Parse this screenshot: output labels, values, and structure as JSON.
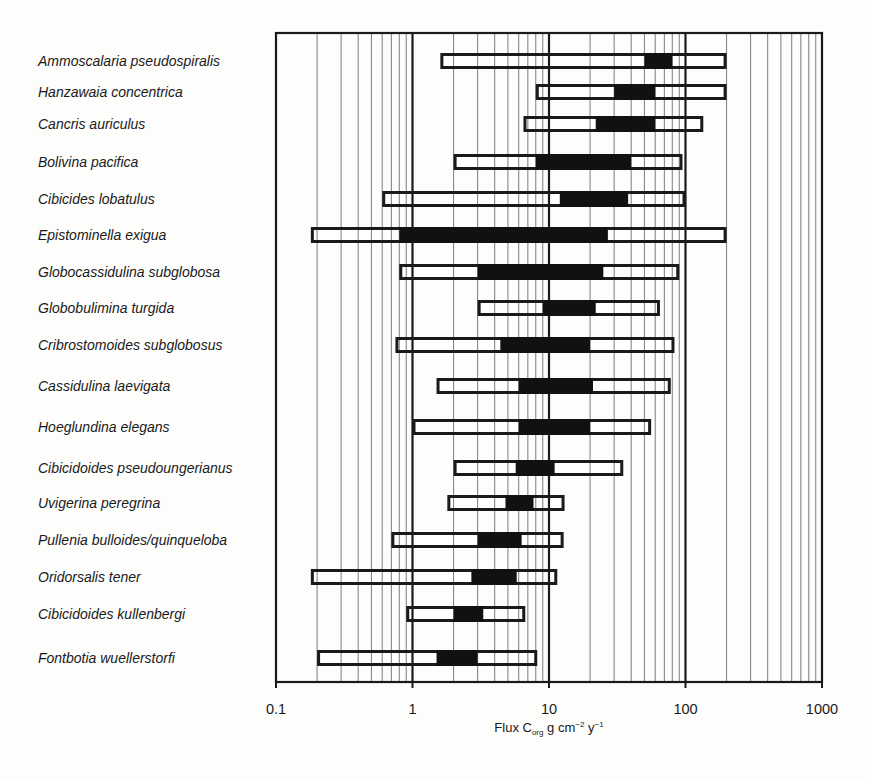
{
  "chart_data": {
    "type": "range-bar",
    "title": "",
    "xlabel": "Flux C_org g cm^-2 y^-1",
    "xlabel_parts": {
      "main": "Flux C",
      "sub": "org",
      "mid": " g cm",
      "sup1": "−2",
      "mid2": " y",
      "sup2": "−1"
    },
    "ylabel": "",
    "xscale": "log",
    "xlim": [
      0.1,
      1000
    ],
    "x_ticks": [
      0.1,
      1,
      10,
      100,
      1000
    ],
    "x_tick_labels": [
      "0.1",
      "1",
      "10",
      "100",
      "1000"
    ],
    "grid": {
      "vertical_minor": true,
      "vertical_major_bold": true,
      "horizontal": false
    },
    "legend": null,
    "series": [
      {
        "name": "Total range (min–max)",
        "style": "open bar"
      },
      {
        "name": "Preferred range",
        "style": "filled bar"
      }
    ],
    "categories": [
      "Ammoscalaria pseudospiralis",
      "Hanzawaia concentrica",
      "Cancris auriculus",
      "Bolivina pacifica",
      "Cibicides lobatulus",
      "Epistominella exigua",
      "Globocassidulina subglobosa",
      "Globobulimina turgida",
      "Cribrostomoides subglobosus",
      "Cassidulina laevigata",
      "Hoeglundina elegans",
      "Cibicidoides pseudoungerianus",
      "Uvigerina peregrina",
      "Pullenia bulloides/quinqueloba",
      "Oridorsalis tener",
      "Cibicidoides kullenbergi",
      "Fontbotia wuellerstorfi"
    ],
    "rows": [
      {
        "species": "Ammoscalaria pseudospiralis",
        "min": 1.6,
        "pref_min": 50,
        "pref_max": 80,
        "max": 200
      },
      {
        "species": "Hanzawaia concentrica",
        "min": 8,
        "pref_min": 30,
        "pref_max": 60,
        "max": 200
      },
      {
        "species": "Cancris auriculus",
        "min": 6.5,
        "pref_min": 22,
        "pref_max": 60,
        "max": 135
      },
      {
        "species": "Bolivina pacifica",
        "min": 2,
        "pref_min": 8,
        "pref_max": 40,
        "max": 95
      },
      {
        "species": "Cibicides lobatulus",
        "min": 0.6,
        "pref_min": 12,
        "pref_max": 38,
        "max": 100
      },
      {
        "species": "Epistominella exigua",
        "min": 0.18,
        "pref_min": 0.8,
        "pref_max": 27,
        "max": 200
      },
      {
        "species": "Globocassidulina subglobosa",
        "min": 0.8,
        "pref_min": 3,
        "pref_max": 25,
        "max": 90
      },
      {
        "species": "Globobulimina turgida",
        "min": 3,
        "pref_min": 9,
        "pref_max": 22,
        "max": 65
      },
      {
        "species": "Cribrostomoides subglobosus",
        "min": 0.75,
        "pref_min": 4.4,
        "pref_max": 20,
        "max": 83
      },
      {
        "species": "Cassidulina laevigata",
        "min": 1.5,
        "pref_min": 6,
        "pref_max": 21,
        "max": 78
      },
      {
        "species": "Hoeglundina elegans",
        "min": 1,
        "pref_min": 6,
        "pref_max": 20,
        "max": 56
      },
      {
        "species": "Cibicidoides pseudoungerianus",
        "min": 2,
        "pref_min": 5.7,
        "pref_max": 11,
        "max": 35
      },
      {
        "species": "Uvigerina peregrina",
        "min": 1.8,
        "pref_min": 4.8,
        "pref_max": 7.7,
        "max": 13
      },
      {
        "species": "Pullenia bulloides/quinqueloba",
        "min": 0.7,
        "pref_min": 3,
        "pref_max": 6.3,
        "max": 12.8
      },
      {
        "species": "Oridorsalis tener",
        "min": 0.18,
        "pref_min": 2.7,
        "pref_max": 5.8,
        "max": 11.5
      },
      {
        "species": "Cibicidoides kullenbergi",
        "min": 0.9,
        "pref_min": 2,
        "pref_max": 3.3,
        "max": 6.7
      },
      {
        "species": "Fontbotia wuellerstorfi",
        "min": 0.2,
        "pref_min": 1.5,
        "pref_max": 3,
        "max": 8.2
      }
    ],
    "row_y_centers": [
      61,
      92,
      124,
      162,
      199,
      235,
      272,
      308,
      345,
      386,
      427,
      468,
      503,
      540,
      577,
      614,
      658
    ]
  },
  "colors": {
    "background": "#fdfdfc",
    "ink": "#1a1a1a",
    "grid_minor": "#6e6e6e",
    "bar_fill_open": "#ffffff",
    "bar_fill_pref": "#111111"
  }
}
